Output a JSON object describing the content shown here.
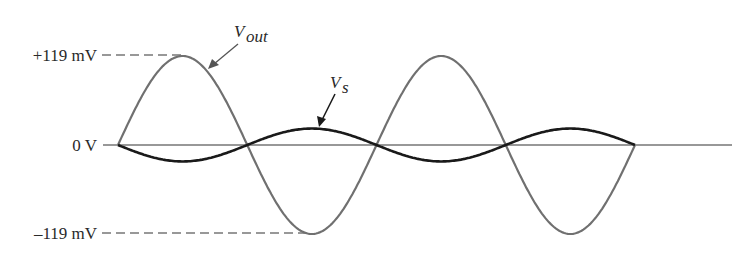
{
  "diagram": {
    "type": "waveform",
    "labels": {
      "pos_peak": "+119 mV",
      "zero": "0 V",
      "neg_peak": "–119 mV",
      "vout_main": "V",
      "vout_sub": "out",
      "vs_main": "V",
      "vs_sub": "s"
    },
    "colors": {
      "vout": "#707070",
      "vs": "#1a1a1a",
      "axis": "#333333",
      "text": "#2a2a2a"
    }
  },
  "chart_data": {
    "type": "line",
    "title": "",
    "xlabel": "",
    "ylabel": "",
    "y_tick_labels": [
      "+119 mV",
      "0 V",
      "–119 mV"
    ],
    "ylim": [
      -119,
      119
    ],
    "cycles_shown": 2,
    "series": [
      {
        "name": "Vout",
        "amplitude_mV": 119,
        "phase_deg": 0,
        "shape": "sine"
      },
      {
        "name": "Vs",
        "amplitude_mV": 22,
        "phase_deg": 180,
        "shape": "sine"
      }
    ],
    "annotations": [
      "Vout (arrow to output waveform)",
      "Vs (arrow to source waveform)"
    ],
    "grid": false
  }
}
